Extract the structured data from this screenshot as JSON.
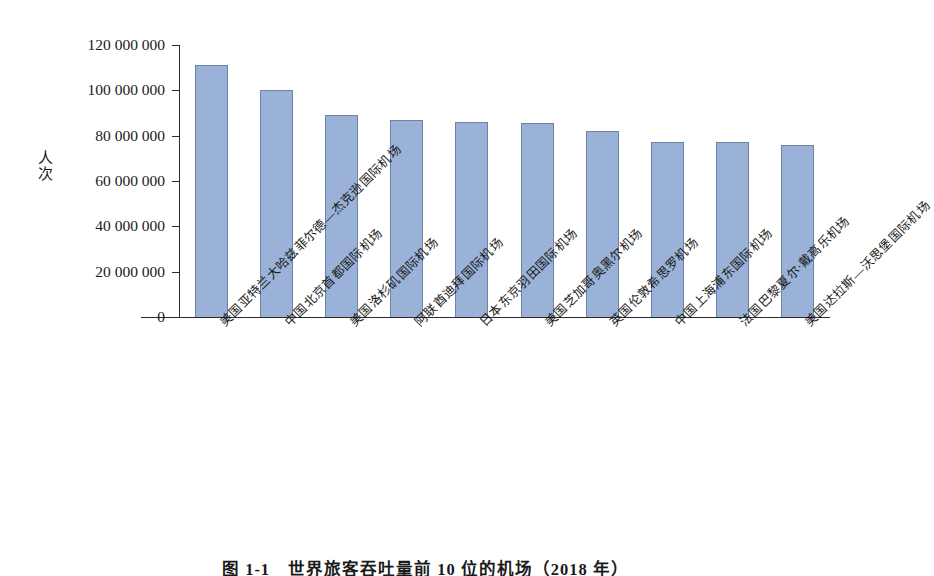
{
  "chart_data": {
    "type": "bar",
    "title": "图 1-1　世界旅客吞吐量前 10 位的机场（2018 年）",
    "xlabel": "",
    "ylabel": "人次",
    "ylim": [
      0,
      120000000
    ],
    "ytick_step": 20000000,
    "grid": false,
    "legend": "none",
    "categories": [
      "美国亚特兰大哈兹菲尔德—杰克逊国际机场",
      "中国北京首都国际机场",
      "美国洛杉矶国际机场",
      "阿联酋迪拜国际机场",
      "日本东京羽田国际机场",
      "美国芝加哥奥黑尔机场",
      "英国伦敦希思罗机场",
      "中国上海浦东国际机场",
      "法国巴黎夏尔·戴高乐机场",
      "美国达拉斯—沃思堡国际机场"
    ],
    "values": [
      111000000,
      100000000,
      89000000,
      87000000,
      86000000,
      85500000,
      82000000,
      77000000,
      77000000,
      76000000
    ],
    "ytick_labels": [
      "0",
      "20 000 000",
      "40 000 000",
      "60 000 000",
      "80 000 000",
      "100 000 000",
      "120 000 000"
    ],
    "ytick_values": [
      0,
      20000000,
      40000000,
      60000000,
      80000000,
      100000000,
      120000000
    ],
    "bar_color": "#8fa9d4",
    "bar_edge_color": "#6d82a8",
    "axis_color": "#2b2b2b"
  }
}
